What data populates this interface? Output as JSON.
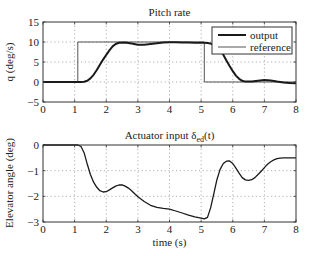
{
  "chart_data": [
    {
      "type": "line",
      "title": "Pitch rate",
      "xlabel": "",
      "ylabel": "q (deg/s)",
      "xlim": [
        0,
        8
      ],
      "ylim": [
        -5,
        15
      ],
      "xticks": [
        0,
        1,
        2,
        3,
        4,
        5,
        6,
        7,
        8
      ],
      "yticks": [
        -5,
        0,
        5,
        10,
        15
      ],
      "grid": true,
      "legend": {
        "position": "upper right",
        "entries": [
          "output",
          "reference"
        ]
      },
      "series": [
        {
          "name": "output",
          "color": "#1a1a1a",
          "width": 2,
          "x": [
            0,
            1.0,
            1.1,
            1.2,
            1.3,
            1.4,
            1.5,
            1.6,
            1.7,
            1.8,
            1.9,
            2.0,
            2.1,
            2.2,
            2.3,
            2.4,
            2.6,
            2.8,
            3.0,
            3.2,
            3.4,
            3.6,
            3.8,
            4.0,
            4.2,
            4.4,
            4.6,
            4.8,
            5.0,
            5.1,
            5.2,
            5.3,
            5.4,
            5.5,
            5.6,
            5.7,
            5.8,
            5.9,
            6.0,
            6.1,
            6.2,
            6.3,
            6.4,
            6.6,
            6.8,
            7.0,
            7.2,
            7.4,
            7.6,
            7.8,
            8.0
          ],
          "y": [
            0,
            0,
            0,
            0,
            0.05,
            0.3,
            0.9,
            1.8,
            3.0,
            4.3,
            5.6,
            6.8,
            7.9,
            8.9,
            9.5,
            9.8,
            9.9,
            9.6,
            9.3,
            9.3,
            9.5,
            9.7,
            9.85,
            9.95,
            9.95,
            9.9,
            9.85,
            9.8,
            9.8,
            9.8,
            9.75,
            9.6,
            9.3,
            8.8,
            8.0,
            6.8,
            5.4,
            4.0,
            2.7,
            1.6,
            0.8,
            0.3,
            0.1,
            0.1,
            0.3,
            0.5,
            0.35,
            0.1,
            -0.1,
            -0.25,
            -0.3
          ]
        },
        {
          "name": "reference",
          "color": "#555555",
          "width": 1,
          "x": [
            0,
            1.1,
            1.1,
            5.1,
            5.1,
            8.0
          ],
          "y": [
            0,
            0,
            10,
            10,
            0,
            0
          ]
        }
      ]
    },
    {
      "type": "line",
      "title": "Actuator input δ_ed(t)",
      "title_main": "Actuator input δ",
      "title_sub": "ed",
      "title_tail": "(t)",
      "xlabel": "time (s)",
      "ylabel": "Elevator angle (deg)",
      "xlim": [
        0,
        8
      ],
      "ylim": [
        -3,
        0
      ],
      "xticks": [
        0,
        1,
        2,
        3,
        4,
        5,
        6,
        7,
        8
      ],
      "yticks": [
        -3,
        -2,
        -1,
        0
      ],
      "grid": true,
      "series": [
        {
          "name": "elevator",
          "color": "#1a1a1a",
          "width": 1.3,
          "x": [
            0,
            1.0,
            1.1,
            1.2,
            1.3,
            1.4,
            1.5,
            1.6,
            1.7,
            1.8,
            1.9,
            2.0,
            2.1,
            2.2,
            2.3,
            2.4,
            2.5,
            2.6,
            2.7,
            2.8,
            2.9,
            3.0,
            3.2,
            3.4,
            3.6,
            3.8,
            4.0,
            4.2,
            4.4,
            4.6,
            4.8,
            5.0,
            5.1,
            5.2,
            5.3,
            5.4,
            5.5,
            5.6,
            5.7,
            5.8,
            5.9,
            6.0,
            6.1,
            6.2,
            6.3,
            6.4,
            6.5,
            6.6,
            6.7,
            6.8,
            6.9,
            7.0,
            7.1,
            7.2,
            7.3,
            7.4,
            7.5,
            7.6,
            7.7,
            7.8,
            8.0
          ],
          "y": [
            0,
            0,
            0,
            -0.05,
            -0.3,
            -0.75,
            -1.15,
            -1.45,
            -1.65,
            -1.78,
            -1.83,
            -1.82,
            -1.75,
            -1.67,
            -1.6,
            -1.56,
            -1.55,
            -1.6,
            -1.68,
            -1.78,
            -1.9,
            -2.02,
            -2.2,
            -2.35,
            -2.43,
            -2.47,
            -2.5,
            -2.57,
            -2.65,
            -2.73,
            -2.8,
            -2.85,
            -2.88,
            -2.82,
            -2.45,
            -1.9,
            -1.35,
            -0.95,
            -0.72,
            -0.63,
            -0.62,
            -0.72,
            -0.9,
            -1.1,
            -1.27,
            -1.36,
            -1.38,
            -1.35,
            -1.27,
            -1.15,
            -1.02,
            -0.88,
            -0.75,
            -0.65,
            -0.58,
            -0.53,
            -0.51,
            -0.5,
            -0.5,
            -0.5,
            -0.5
          ]
        }
      ]
    }
  ]
}
